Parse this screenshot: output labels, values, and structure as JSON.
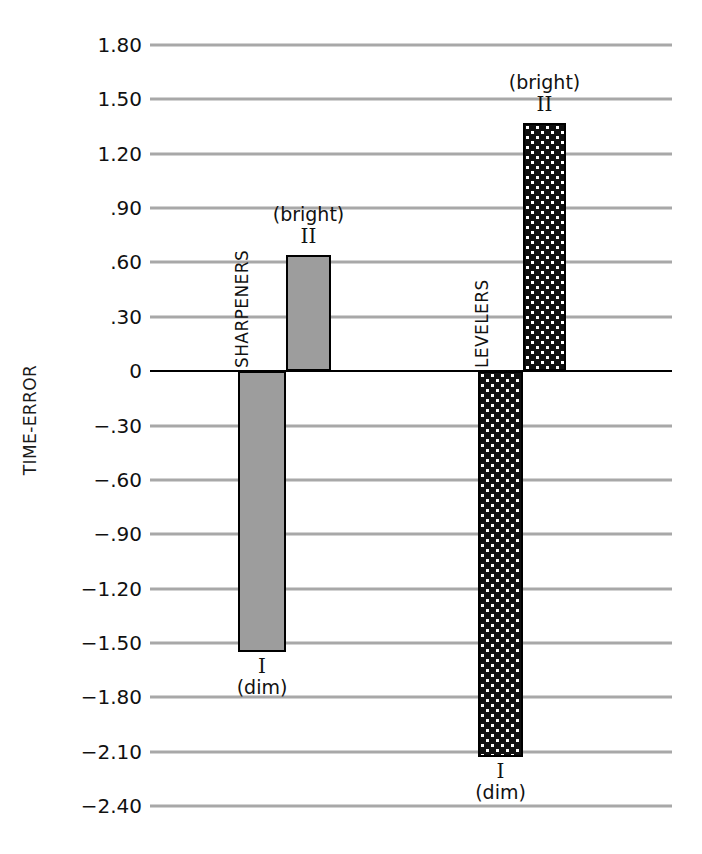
{
  "chart_data": {
    "type": "bar",
    "title": "",
    "subtitle": "",
    "xlabel": "",
    "ylabel": "TIME-ERROR",
    "ylim": [
      -2.4,
      1.8
    ],
    "y_ticks": [
      1.8,
      1.5,
      1.2,
      0.9,
      0.6,
      0.3,
      0,
      -0.3,
      -0.6,
      -0.9,
      -1.2,
      -1.5,
      -1.8,
      -2.1,
      -2.4
    ],
    "y_tick_labels": [
      "1.80",
      "1.50",
      "1.20",
      ".90",
      ".60",
      ".30",
      "0",
      "−.30",
      "−.60",
      "−.90",
      "−1.20",
      "−1.50",
      "−1.80",
      "−2.10",
      "−2.40"
    ],
    "grid": true,
    "legend": "none",
    "zero_line": 0,
    "groups": [
      {
        "name": "SHARPENERS",
        "fill": "solid-gray",
        "fill_color": "#9d9d9d",
        "bars": [
          {
            "label": "I",
            "condition": "(dim)",
            "value": -1.55
          },
          {
            "label": "II",
            "condition": "(bright)",
            "value": 0.64
          }
        ]
      },
      {
        "name": "LEVELERS",
        "fill": "dotted-dark",
        "fill_color": "#101010",
        "bars": [
          {
            "label": "I",
            "condition": "(dim)",
            "value": -2.13
          },
          {
            "label": "II",
            "condition": "(bright)",
            "value": 1.37
          }
        ]
      }
    ],
    "categories": [
      "SHARPENERS I (dim)",
      "SHARPENERS II (bright)",
      "LEVELERS I (dim)",
      "LEVELERS II (bright)"
    ],
    "values": [
      -1.55,
      0.64,
      -2.13,
      1.37
    ]
  },
  "axis": {
    "ylabel": "TIME-ERROR",
    "ticks": [
      {
        "value": 1.8,
        "text": "1.80"
      },
      {
        "value": 1.5,
        "text": "1.50"
      },
      {
        "value": 1.2,
        "text": "1.20"
      },
      {
        "value": 0.9,
        "text": ".90"
      },
      {
        "value": 0.6,
        "text": ".60"
      },
      {
        "value": 0.3,
        "text": ".30"
      },
      {
        "value": 0,
        "text": "0"
      },
      {
        "value": -0.3,
        "text": "−.30"
      },
      {
        "value": -0.6,
        "text": "−.60"
      },
      {
        "value": -0.9,
        "text": "−.90"
      },
      {
        "value": -1.2,
        "text": "−1.20"
      },
      {
        "value": -1.5,
        "text": "−1.50"
      },
      {
        "value": -1.8,
        "text": "−1.80"
      },
      {
        "value": -2.1,
        "text": "−2.10"
      },
      {
        "value": -2.4,
        "text": "−2.40"
      }
    ]
  },
  "groups": {
    "sharpeners": {
      "name": "SHARPENERS",
      "bar_i_label": "I",
      "bar_i_condition": "(dim)",
      "bar_ii_label": "II",
      "bar_ii_condition": "(bright)"
    },
    "levelers": {
      "name": "LEVELERS",
      "bar_i_label": "I",
      "bar_i_condition": "(dim)",
      "bar_ii_label": "II",
      "bar_ii_condition": "(bright)"
    }
  },
  "colors": {
    "sharpeners_fill": "#9d9d9d",
    "levelers_fill": "#101010",
    "gridline": "#a8a8a8",
    "zero_line": "#000000",
    "bar_outline": "#000000",
    "text": "#111111"
  }
}
